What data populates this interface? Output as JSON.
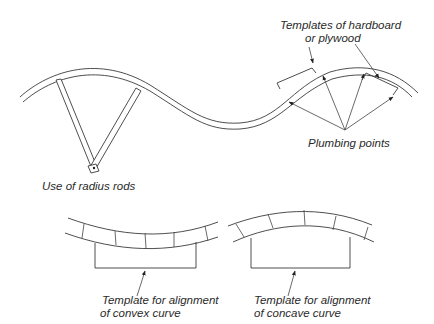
{
  "diagram": {
    "type": "technical illustration",
    "labels": {
      "templates": [
        "Templates of hardboard",
        "or plywood"
      ],
      "plumbing_points": "Plumbing points",
      "radius_rods": "Use of radius rods",
      "convex_template": [
        "Template for alignment",
        "of convex curve"
      ],
      "concave_template": [
        "Template for alignment",
        "of concave curve"
      ]
    },
    "colors": {
      "line": "#3a3a3a",
      "text": "#2a2a2a",
      "background": "#ffffff"
    }
  }
}
